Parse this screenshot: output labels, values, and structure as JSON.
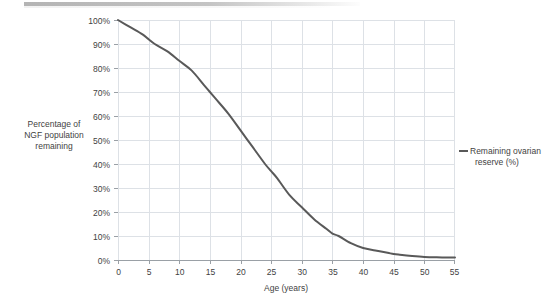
{
  "chart_data": {
    "type": "line",
    "title": "",
    "subtitle": "",
    "xlabel": "Age (years)",
    "ylabel": "Percentage of NGF population remaining",
    "ylabel_lines": [
      "Percentage of",
      "NGF population",
      "remaining"
    ],
    "xlim": [
      0,
      55
    ],
    "ylim": [
      0,
      100
    ],
    "xticks": [
      0,
      5,
      10,
      15,
      20,
      25,
      30,
      35,
      40,
      45,
      50,
      55
    ],
    "xtick_labels": [
      "0",
      "5",
      "10",
      "15",
      "20",
      "25",
      "30",
      "35",
      "40",
      "45",
      "50",
      "55"
    ],
    "yticks": [
      0,
      10,
      20,
      30,
      40,
      50,
      60,
      70,
      80,
      90,
      100
    ],
    "ytick_labels": [
      "0%",
      "10%",
      "20%",
      "30%",
      "40%",
      "50%",
      "60%",
      "70%",
      "80%",
      "90%",
      "100%"
    ],
    "grid": true,
    "grid_color": "#d9dde2",
    "legend_position": "right",
    "legend": [
      "Remaining ovarian reserve (%)"
    ],
    "series": [
      {
        "name": "Remaining ovarian reserve (%)",
        "color": "#595959",
        "line_width": 2,
        "x": [
          0,
          2,
          4,
          5,
          6,
          8,
          10,
          12,
          14,
          15,
          16,
          18,
          20,
          22,
          24,
          25,
          26,
          28,
          30,
          32,
          34,
          35,
          36,
          38,
          40,
          42,
          44,
          45,
          46,
          48,
          50,
          52,
          54,
          55
        ],
        "values": [
          100,
          97,
          94,
          92,
          90,
          87,
          83,
          79,
          73,
          70,
          67,
          61,
          54,
          47,
          40,
          37,
          34,
          27,
          22,
          17,
          13,
          11,
          10,
          7,
          5,
          4,
          3,
          2.5,
          2.2,
          1.7,
          1.3,
          1.1,
          1.0,
          1.0
        ]
      }
    ],
    "annotations": []
  },
  "legend": {
    "entry_line1": "Remaining ovarian",
    "entry_line2": "reserve (%)",
    "swatch_icon": "line-swatch-icon"
  },
  "axes": {
    "y_title_line1": "Percentage of",
    "y_title_line2": "NGF population",
    "y_title_line3": "remaining",
    "x_title": "Age (years)"
  }
}
